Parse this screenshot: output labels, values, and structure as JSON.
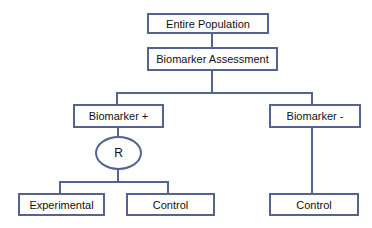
{
  "diagram": {
    "type": "flowchart",
    "nodes": {
      "entire_population": "Entire Population",
      "biomarker_assessment": "Biomarker Assessment",
      "biomarker_pos": "Biomarker +",
      "biomarker_neg": "Biomarker -",
      "randomization": "R",
      "experimental": "Experimental",
      "control_pos": "Control",
      "control_neg": "Control"
    },
    "edges": [
      [
        "Entire Population",
        "Biomarker Assessment"
      ],
      [
        "Biomarker Assessment",
        "Biomarker +"
      ],
      [
        "Biomarker Assessment",
        "Biomarker -"
      ],
      [
        "Biomarker +",
        "R"
      ],
      [
        "R",
        "Experimental"
      ],
      [
        "R",
        "Control"
      ],
      [
        "Biomarker -",
        "Control"
      ]
    ],
    "colors": {
      "border": "#55638f",
      "line": "#55638f",
      "background": "#ffffff"
    }
  }
}
